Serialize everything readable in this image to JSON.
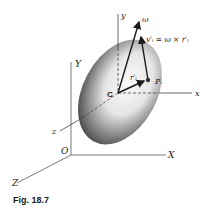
{
  "figure": {
    "caption": "Fig. 18.7",
    "labels": {
      "big_Y": "Y",
      "big_X": "X",
      "big_Z": "Z",
      "origin": "O",
      "small_y": "y",
      "small_x": "x",
      "small_z": "z",
      "center": "C",
      "omega": "ω",
      "velocity_eq": "v′ᵢ = ω × r′ᵢ",
      "r_prime": "r′ᵢ",
      "point": "Pᵢ"
    }
  },
  "colors": {
    "axis": "#555555",
    "vector": "#1a1a1a",
    "body_dark": "#3a3a3a",
    "body_light": "#f2f2f2"
  }
}
